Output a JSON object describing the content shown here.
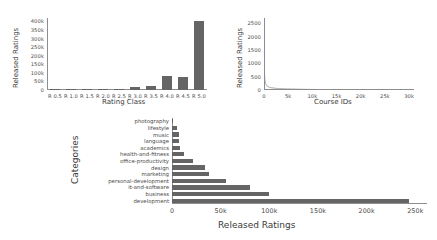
{
  "chart_data": [
    {
      "id": "rating-class-bars",
      "type": "bar",
      "title": "",
      "xlabel": "Rating Class",
      "ylabel": "Released Ratings",
      "categories": [
        "R 0.5",
        "R 1.0",
        "R 1.5",
        "R 2.0",
        "R 2.5",
        "R 3.0",
        "R 3.5",
        "R 4.0",
        "R 4.5",
        "R 5.0"
      ],
      "values": [
        900,
        1200,
        1800,
        3000,
        4500,
        20000,
        22000,
        80000,
        75000,
        400000
      ],
      "ylim": [
        0,
        420000
      ],
      "yticks": [
        0,
        50000,
        100000,
        150000,
        200000,
        250000,
        300000,
        350000,
        400000
      ],
      "ytick_labels": [
        "0",
        "50k",
        "100k",
        "150k",
        "200k",
        "250k",
        "300k",
        "350k",
        "400k"
      ],
      "grid": false,
      "bar_color": "#656565"
    },
    {
      "id": "course-ids-line",
      "type": "line",
      "title": "",
      "xlabel": "Course IDs",
      "ylabel": "Released Ratings",
      "xlim": [
        0,
        31000
      ],
      "ylim": [
        0,
        2700
      ],
      "xticks": [
        0,
        5000,
        10000,
        15000,
        20000,
        25000,
        30000
      ],
      "xtick_labels": [
        "0",
        "5k",
        "10k",
        "15k",
        "20k",
        "25k",
        "30k"
      ],
      "yticks": [
        0,
        500,
        1000,
        1500,
        2000,
        2500
      ],
      "ytick_labels": [
        "0",
        "500",
        "1000",
        "1500",
        "2000",
        "2500"
      ],
      "grid": false,
      "line_color": "#8d8d8d",
      "description": "Steeply decaying sorted-ratings curve: starts near 2650 at x=0, drops below 500 within the first ~250 course IDs, then flattens toward 0 across the remaining range.",
      "x": [
        0,
        60,
        150,
        300,
        600,
        1200,
        2500,
        5000,
        8000,
        12000,
        16000,
        20000,
        24000,
        27000,
        30000
      ],
      "y": [
        2650,
        900,
        430,
        250,
        150,
        95,
        60,
        38,
        25,
        16,
        11,
        8,
        5,
        3,
        1
      ]
    },
    {
      "id": "categories-bars",
      "type": "bar",
      "orientation": "horizontal",
      "title": "",
      "xlabel": "Released Ratings",
      "ylabel": "Categories",
      "categories": [
        "photography",
        "lifestyle",
        "music",
        "language",
        "academics",
        "health-and-fitness",
        "office-productivity",
        "design",
        "marketing",
        "personal-development",
        "it-and-software",
        "business",
        "development"
      ],
      "values": [
        1500,
        5000,
        7000,
        7500,
        8000,
        12000,
        22000,
        34000,
        38000,
        55000,
        80000,
        100000,
        243000
      ],
      "xlim": [
        0,
        262000
      ],
      "xticks": [
        0,
        50000,
        100000,
        150000,
        200000,
        250000
      ],
      "xtick_labels": [
        "0",
        "50k",
        "100k",
        "150k",
        "200k",
        "250k"
      ],
      "grid": false,
      "bar_color": "#656565"
    }
  ]
}
